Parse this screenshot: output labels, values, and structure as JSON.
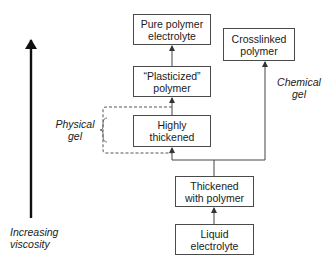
{
  "diagram": {
    "nodes": [
      {
        "id": "pure",
        "label": "Pure polymer electrolyte",
        "lines": [
          "Pure polymer",
          "electrolyte"
        ]
      },
      {
        "id": "crosslinked",
        "label": "Crosslinked polymer",
        "lines": [
          "Crosslinked",
          "polymer"
        ]
      },
      {
        "id": "plasticized",
        "label": "“Plasticized” polymer",
        "lines": [
          "“Plasticized”",
          "polymer"
        ]
      },
      {
        "id": "highly",
        "label": "Highly thickened",
        "lines": [
          "Highly",
          "thickened"
        ]
      },
      {
        "id": "thickened",
        "label": "Thickened with polymer",
        "lines": [
          "Thickened",
          "with polymer"
        ]
      },
      {
        "id": "liquid",
        "label": "Liquid electrolyte",
        "lines": [
          "Liquid",
          "electrolyte"
        ]
      }
    ],
    "edges": [
      {
        "from": "liquid",
        "to": "thickened",
        "style": "solid"
      },
      {
        "from": "thickened",
        "to": "highly",
        "style": "solid"
      },
      {
        "from": "thickened",
        "to": "crosslinked",
        "style": "solid"
      },
      {
        "from": "highly",
        "to": "plasticized",
        "style": "solid"
      },
      {
        "from": "plasticized",
        "to": "pure",
        "style": "solid"
      }
    ],
    "annotations": {
      "physical_gel": [
        "Physical",
        "gel"
      ],
      "chemical_gel": [
        "Chemical",
        "gel"
      ],
      "axis_label": [
        "Increasing",
        "viscosity"
      ]
    }
  }
}
